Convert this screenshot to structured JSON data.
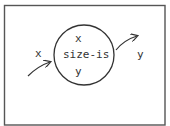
{
  "diagram": {
    "node": {
      "label": "size-is",
      "input_var": "x",
      "output_var": "y"
    },
    "input": {
      "label": "x"
    },
    "output": {
      "label": "y"
    }
  },
  "colors": {
    "stroke": "#333333",
    "frame": "#555555",
    "background": "#ffffff"
  }
}
